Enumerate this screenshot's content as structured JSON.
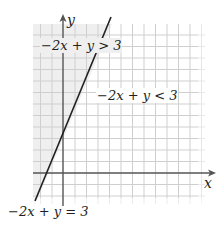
{
  "graph": {
    "x_axis_label": "x",
    "y_axis_label": "y",
    "region_above_label": "−2x + y > 3",
    "region_below_label": "−2x + y < 3",
    "boundary_label": "−2x + y = 3",
    "shaded_region": "-2x + y > 3",
    "boundary_equation": "y = 2x + 3",
    "colors": {
      "grid": "#c8c8c8",
      "axis": "#555555",
      "boundary_line": "#231f20",
      "shade": "#f0f0f0"
    }
  }
}
